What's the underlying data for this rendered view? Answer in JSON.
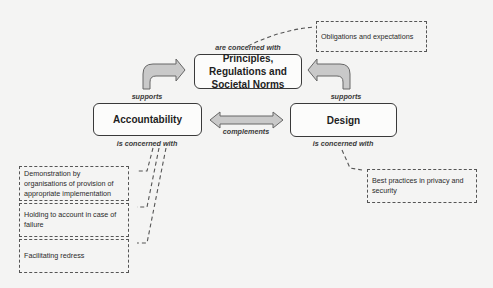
{
  "nodes": {
    "principles": "Principles, Regulations and Societal Norms",
    "accountability": "Accountability",
    "design": "Design"
  },
  "edge_labels": {
    "principles_concern": "are concerned with",
    "accountability_supports": "supports",
    "design_supports": "supports",
    "complements": "complements",
    "accountability_concern": "is concerned with",
    "design_concern": "is concerned with"
  },
  "notes": {
    "obligations": "Obligations and expectations",
    "demonstration": "Demonstration by organisations of provision of appropriate implementation",
    "holding": "Holding to account in case of failure",
    "redress": "Facilitating redress",
    "best_practices": "Best practices in privacy and security"
  },
  "colors": {
    "arrow_fill": "#c9c9c9",
    "arrow_stroke": "#666666",
    "border": "#3a3a3a",
    "background": "#f4f4f3"
  }
}
